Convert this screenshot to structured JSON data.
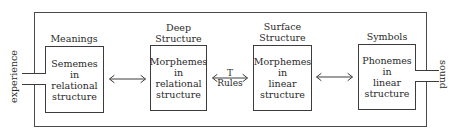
{
  "diagram": {
    "input_label": "experience",
    "output_label": "sound",
    "stages": [
      {
        "heading": [
          "Meanings"
        ],
        "content": [
          "Sememes",
          "in",
          "relational",
          "structure"
        ]
      },
      {
        "heading": [
          "Deep",
          "Structure"
        ],
        "content": [
          "Morphemes",
          "in",
          "relational",
          "structure"
        ]
      },
      {
        "heading": [
          "Surface",
          "Structure"
        ],
        "content": [
          "Morphemes",
          "in",
          "linear",
          "structure"
        ]
      },
      {
        "heading": [
          "Symbols"
        ],
        "content": [
          "Phonemes",
          "in",
          "linear",
          "structure"
        ]
      }
    ],
    "connectors": [
      {
        "from": 0,
        "to": 1,
        "type": "bidirectional-arrow",
        "label": []
      },
      {
        "from": 1,
        "to": 2,
        "type": "bidirectional-arrow",
        "label": [
          "T",
          "Rules"
        ]
      },
      {
        "from": 2,
        "to": 3,
        "type": "bidirectional-arrow",
        "label": []
      }
    ],
    "colors": {
      "line": "#3c3c3c",
      "text": "#2a2a2a",
      "background": "#ffffff"
    }
  }
}
